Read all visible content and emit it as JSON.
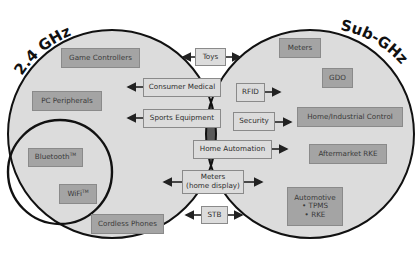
{
  "diagram": {
    "type": "venn",
    "colors": {
      "circle_fill": "#dcdcdc",
      "intersection_fill": "#5a5a5a",
      "outline": "#111111",
      "box_dark": "#a4a4a4",
      "box_light": "#dcdcdc"
    },
    "sets": {
      "left": {
        "label": "2.4 GHz"
      },
      "right": {
        "label": "Sub-GHz"
      }
    },
    "left_only": {
      "game_controllers": "Game Controllers",
      "pc_peripherals": "PC Peripherals",
      "bluetooth": "Bluetooth",
      "bluetooth_tm": "TM",
      "wifi": "WiFi",
      "wifi_tm": "TM",
      "cordless_phones": "Cordless Phones"
    },
    "right_only": {
      "meters": "Meters",
      "gdo": "GDO",
      "home_industrial_control": "Home/Industrial Control",
      "aftermarket_rke": "Aftermarket RKE",
      "automotive_title": "Automotive",
      "automotive_item1": "• TPMS",
      "automotive_item2": "• RKE"
    },
    "intersection": {
      "toys": "Toys",
      "consumer_medical": "Consumer Medical",
      "sports_equipment": "Sports Equipment",
      "rfid": "RFID",
      "security": "Security",
      "home_automation": "Home Automation",
      "meters_home_display_line1": "Meters",
      "meters_home_display_line2": "(home display)",
      "stb": "STB"
    }
  }
}
